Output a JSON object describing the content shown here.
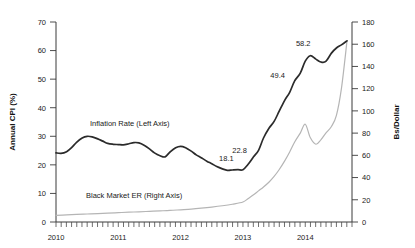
{
  "chart_data": {
    "type": "line",
    "title": "",
    "subtitle": "",
    "xlabel": "",
    "grid": false,
    "legend_position": "inline-annotations",
    "x_axis": {
      "tick_labels": [
        "2010",
        "2011",
        "2012",
        "2013",
        "2014"
      ],
      "range_start": 2010.0,
      "range_end": 2014.75,
      "minor_tick_interval_months": 1
    },
    "left_axis": {
      "label": "Annual CPI (%)",
      "ticks": [
        0,
        10,
        20,
        30,
        40,
        50,
        60,
        70
      ],
      "ylim": [
        0,
        70
      ]
    },
    "right_axis": {
      "label": "Bs/Dollar",
      "ticks": [
        0,
        20,
        40,
        60,
        80,
        100,
        120,
        140,
        160,
        180
      ],
      "ylim": [
        0,
        180
      ]
    },
    "series": [
      {
        "name": "Inflation Rate (Left Axis)",
        "axis": "left",
        "color": "#2b2b2b",
        "label_text": "Inflation Rate (Left Axis)",
        "x": [
          2010.0,
          2010.08,
          2010.17,
          2010.25,
          2010.33,
          2010.42,
          2010.5,
          2010.58,
          2010.67,
          2010.75,
          2010.83,
          2010.92,
          2011.0,
          2011.08,
          2011.17,
          2011.25,
          2011.33,
          2011.42,
          2011.5,
          2011.58,
          2011.67,
          2011.75,
          2011.83,
          2011.92,
          2012.0,
          2012.08,
          2012.17,
          2012.25,
          2012.33,
          2012.42,
          2012.5,
          2012.58,
          2012.67,
          2012.75,
          2012.83,
          2012.92,
          2013.0,
          2013.08,
          2013.17,
          2013.25,
          2013.33,
          2013.42,
          2013.5,
          2013.58,
          2013.67,
          2013.75,
          2013.83,
          2013.92,
          2014.0,
          2014.08,
          2014.17,
          2014.25,
          2014.33,
          2014.42,
          2014.5,
          2014.58,
          2014.67
        ],
        "values": [
          24.2,
          24.0,
          24.6,
          26.0,
          27.9,
          29.4,
          30.0,
          29.8,
          29.1,
          28.3,
          27.5,
          27.2,
          27.1,
          27.0,
          27.4,
          27.8,
          27.7,
          26.8,
          25.6,
          24.2,
          23.2,
          22.8,
          24.5,
          26.0,
          26.5,
          26.0,
          24.8,
          23.5,
          22.5,
          21.3,
          20.4,
          19.4,
          18.6,
          18.1,
          18.2,
          18.3,
          18.3,
          20.1,
          22.8,
          25.1,
          29.4,
          32.9,
          35.2,
          38.7,
          42.6,
          45.4,
          49.4,
          52.1,
          56.3,
          58.2,
          57.0,
          56.0,
          56.2,
          59.1,
          60.9,
          62.0,
          63.4
        ]
      },
      {
        "name": "Black Market ER (Right Axis)",
        "axis": "right",
        "color": "#b5b5b5",
        "label_text": "Black Market ER (Right Axis)",
        "x": [
          2010.0,
          2010.17,
          2010.33,
          2010.5,
          2010.67,
          2010.83,
          2011.0,
          2011.17,
          2011.33,
          2011.5,
          2011.67,
          2011.83,
          2012.0,
          2012.17,
          2012.33,
          2012.5,
          2012.67,
          2012.83,
          2013.0,
          2013.08,
          2013.17,
          2013.25,
          2013.33,
          2013.42,
          2013.5,
          2013.58,
          2013.67,
          2013.75,
          2013.83,
          2013.92,
          2014.0,
          2014.08,
          2014.17,
          2014.25,
          2014.33,
          2014.42,
          2014.5,
          2014.58,
          2014.67
        ],
        "values": [
          6.0,
          6.4,
          6.8,
          7.2,
          7.6,
          8.0,
          8.4,
          8.8,
          9.2,
          9.6,
          10.0,
          10.4,
          11.0,
          11.6,
          12.4,
          13.4,
          14.6,
          16.0,
          18.0,
          21.0,
          24.5,
          28.0,
          31.5,
          36.0,
          41.0,
          47.0,
          55.0,
          63.0,
          72.0,
          80.0,
          88.0,
          76.0,
          70.0,
          74.0,
          80.0,
          86.0,
          96.0,
          120.0,
          163.0
        ]
      }
    ],
    "point_labels": [
      {
        "text": "18.1",
        "x": 2012.75,
        "value": 18.1,
        "series": "Inflation Rate (Left Axis)"
      },
      {
        "text": "22.8",
        "x": 2013.17,
        "value": 22.8,
        "series": "Inflation Rate (Left Axis)"
      },
      {
        "text": "49.4",
        "x": 2013.83,
        "value": 49.4,
        "series": "Inflation Rate (Left Axis)"
      },
      {
        "text": "58.2",
        "x": 2014.08,
        "value": 58.2,
        "series": "Inflation Rate (Left Axis)"
      }
    ]
  },
  "colors": {
    "inflation_line": "#2b2b2b",
    "exchange_rate_line": "#b5b5b5",
    "axis": "#3a3a3a",
    "text": "#1a1a1a",
    "background": "#ffffff"
  }
}
